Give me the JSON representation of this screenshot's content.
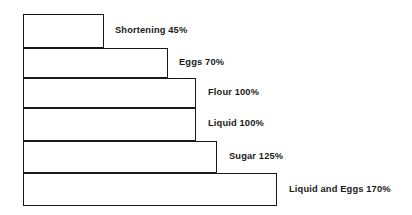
{
  "chart_data": {
    "type": "bar",
    "title": "",
    "subtitle": "",
    "xlabel": "",
    "ylabel": "",
    "orientation": "horizontal",
    "grid": false,
    "legend": "none",
    "axis_visible": false,
    "xlim": [
      0,
      170
    ],
    "categories": [
      "Shortening",
      "Eggs",
      "Flour",
      "Liquid",
      "Sugar",
      "Liquid and Eggs"
    ],
    "values": [
      45,
      70,
      100,
      100,
      125,
      170
    ],
    "unit": "%",
    "data_labels": [
      "Shortening 45%",
      "Eggs 70%",
      "Flour 100%",
      "Liquid 100%",
      "Sugar 125%",
      "Liquid and Eggs 170%"
    ],
    "bar_fill_color": "#ffffff",
    "bar_stroke_color": "#1a1a1a",
    "background_color": "#ffffff",
    "text_color": "#1a1a1a"
  },
  "bars": [
    {
      "name": "shortening",
      "label": "Shortening 45%",
      "value": 45,
      "left": 23,
      "top": 14,
      "width": 81,
      "height": 34,
      "label_left": 115,
      "label_center_y": 31
    },
    {
      "name": "eggs",
      "label": "Eggs 70%",
      "value": 70,
      "left": 23,
      "top": 48,
      "width": 145,
      "height": 30,
      "label_left": 179,
      "label_center_y": 63
    },
    {
      "name": "flour",
      "label": "Flour 100%",
      "value": 100,
      "left": 23,
      "top": 78,
      "width": 173,
      "height": 30,
      "label_left": 208,
      "label_center_y": 93
    },
    {
      "name": "liquid",
      "label": "Liquid 100%",
      "value": 100,
      "left": 23,
      "top": 108,
      "width": 173,
      "height": 33,
      "label_left": 208,
      "label_center_y": 124
    },
    {
      "name": "sugar",
      "label": "Sugar 125%",
      "value": 125,
      "left": 23,
      "top": 141,
      "width": 194,
      "height": 32,
      "label_left": 229,
      "label_center_y": 157
    },
    {
      "name": "liquid-and-eggs",
      "label": "Liquid and Eggs 170%",
      "value": 170,
      "left": 23,
      "top": 173,
      "width": 254,
      "height": 33,
      "label_left": 289,
      "label_center_y": 190
    }
  ]
}
